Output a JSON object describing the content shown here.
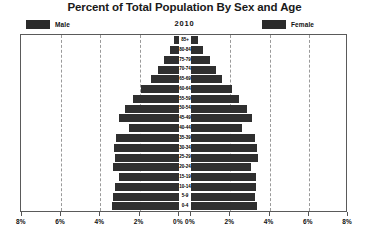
{
  "chart_title": "Percent of Total Population By Sex and Age",
  "year_label": "2010",
  "legend": {
    "male_label": "Male",
    "female_label": "Female",
    "male_color": "#2b2b2b",
    "female_color": "#2b2b2b"
  },
  "axis": {
    "tick_labels_left": [
      "8%",
      "6%",
      "4%",
      "2%",
      "0%"
    ],
    "tick_labels_right": [
      "0%",
      "2%",
      "4%",
      "6%",
      "8%"
    ]
  },
  "chart_data": {
    "type": "bar",
    "subtype": "population-pyramid",
    "title": "Percent of Total Population By Sex and Age",
    "subtitle": "2010",
    "xlabel": "",
    "ylabel": "",
    "xlim": [
      0,
      8
    ],
    "xunit": "%",
    "xticks": [
      0,
      2,
      4,
      6,
      8
    ],
    "grid": true,
    "legend_position": "top",
    "orientation": "horizontal",
    "categories": [
      "85+",
      "80-84",
      "75-79",
      "70-74",
      "65-69",
      "60-64",
      "55-59",
      "50-54",
      "45-49",
      "40-44",
      "35-39",
      "30-34",
      "25-29",
      "20-24",
      "15-19",
      "10-14",
      "5-9",
      "0-4"
    ],
    "series": [
      {
        "name": "Male",
        "side": "left",
        "color": "#2f2f2f",
        "values": [
          0.25,
          0.45,
          0.75,
          1.05,
          1.45,
          1.95,
          2.35,
          2.75,
          3.05,
          2.55,
          3.2,
          3.3,
          3.25,
          3.35,
          3.05,
          3.25,
          3.35,
          3.4
        ]
      },
      {
        "name": "Female",
        "side": "right",
        "color": "#2f2f2f",
        "values": [
          0.35,
          0.6,
          0.95,
          1.25,
          1.6,
          2.1,
          2.45,
          2.85,
          3.1,
          2.6,
          3.25,
          3.35,
          3.4,
          3.05,
          3.3,
          3.3,
          3.25,
          3.35
        ]
      }
    ]
  }
}
